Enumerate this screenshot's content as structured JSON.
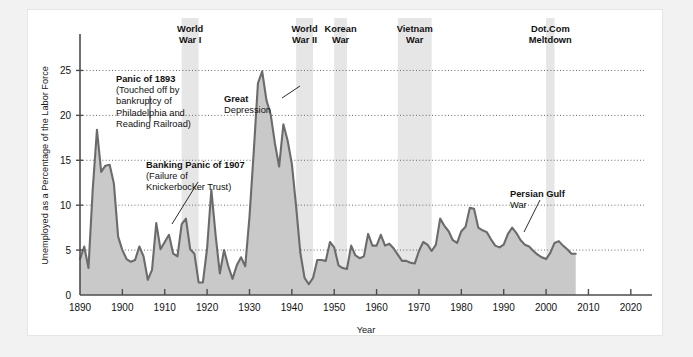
{
  "chart_data": {
    "type": "area",
    "title": "",
    "xlabel": "Year",
    "ylabel": "Unemployed as a Percentage of the Labor Force",
    "xlim": [
      1890,
      2025
    ],
    "ylim": [
      0,
      27.5
    ],
    "xticks": [
      1890,
      1900,
      1910,
      1920,
      1930,
      1940,
      1950,
      1960,
      1970,
      1980,
      1990,
      2000,
      2010,
      2020
    ],
    "yticks": [
      0,
      5,
      10,
      15,
      20,
      25
    ],
    "grid": "horizontal-dotted",
    "legend": "none",
    "series_name": "Unemployment rate",
    "x": [
      1890,
      1891,
      1892,
      1893,
      1894,
      1895,
      1896,
      1897,
      1898,
      1899,
      1900,
      1901,
      1902,
      1903,
      1904,
      1905,
      1906,
      1907,
      1908,
      1909,
      1910,
      1911,
      1912,
      1913,
      1914,
      1915,
      1916,
      1917,
      1918,
      1919,
      1920,
      1921,
      1922,
      1923,
      1924,
      1925,
      1926,
      1927,
      1928,
      1929,
      1930,
      1931,
      1932,
      1933,
      1934,
      1935,
      1936,
      1937,
      1938,
      1939,
      1940,
      1941,
      1942,
      1943,
      1944,
      1945,
      1946,
      1947,
      1948,
      1949,
      1950,
      1951,
      1952,
      1953,
      1954,
      1955,
      1956,
      1957,
      1958,
      1959,
      1960,
      1961,
      1962,
      1963,
      1964,
      1965,
      1966,
      1967,
      1968,
      1969,
      1970,
      1971,
      1972,
      1973,
      1974,
      1975,
      1976,
      1977,
      1978,
      1979,
      1980,
      1981,
      1982,
      1983,
      1984,
      1985,
      1986,
      1987,
      1988,
      1989,
      1990,
      1991,
      1992,
      1993,
      1994,
      1995,
      1996,
      1997,
      1998,
      1999,
      2000,
      2001,
      2002,
      2003,
      2004,
      2005,
      2006,
      2007
    ],
    "values": [
      4.0,
      5.4,
      3.0,
      11.7,
      18.4,
      13.7,
      14.4,
      14.5,
      12.4,
      6.5,
      5.0,
      4.0,
      3.7,
      3.9,
      5.4,
      4.3,
      1.7,
      2.8,
      8.0,
      5.1,
      5.9,
      6.7,
      4.6,
      4.3,
      7.9,
      8.5,
      5.1,
      4.6,
      1.4,
      1.4,
      5.2,
      11.7,
      6.7,
      2.4,
      5.0,
      3.2,
      1.8,
      3.3,
      4.2,
      3.2,
      8.7,
      15.9,
      23.6,
      24.9,
      21.7,
      20.1,
      16.9,
      14.3,
      19.0,
      17.2,
      14.6,
      9.9,
      4.7,
      1.9,
      1.2,
      1.9,
      3.9,
      3.9,
      3.8,
      5.9,
      5.3,
      3.3,
      3.0,
      2.9,
      5.5,
      4.4,
      4.1,
      4.3,
      6.8,
      5.5,
      5.5,
      6.7,
      5.5,
      5.7,
      5.2,
      4.5,
      3.8,
      3.8,
      3.6,
      3.5,
      4.9,
      5.9,
      5.6,
      4.9,
      5.6,
      8.5,
      7.7,
      7.1,
      6.1,
      5.8,
      7.1,
      7.6,
      9.7,
      9.6,
      7.5,
      7.2,
      7.0,
      6.2,
      5.5,
      5.3,
      5.6,
      6.8,
      7.5,
      6.9,
      6.1,
      5.6,
      5.4,
      4.9,
      4.5,
      4.2,
      4.0,
      4.7,
      5.8,
      6.0,
      5.5,
      5.1,
      4.6,
      4.6
    ],
    "annotations": [
      {
        "name": "panic-1893",
        "lines": [
          "Panic of 1893",
          "(Touched off by",
          "bankruptcy of",
          "Philadelphia and",
          "Reading Railroad)"
        ],
        "bold_first_line": true
      },
      {
        "name": "banking-panic-1907",
        "lines": [
          "Banking Panic of 1907",
          "(Failure of",
          "Knickerbocker Trust)"
        ],
        "bold_first_line": true
      },
      {
        "name": "great-depression",
        "lines": [
          "Great",
          "Depression"
        ],
        "bold_first_line": true
      },
      {
        "name": "persian-gulf-war",
        "lines": [
          "Persian Gulf",
          "War"
        ],
        "bold_first_line": true
      }
    ],
    "shaded_bands": [
      {
        "label_lines": [
          "World",
          "War I"
        ],
        "start": 1914,
        "end": 1918
      },
      {
        "label_lines": [
          "World",
          "War II"
        ],
        "start": 1941,
        "end": 1945
      },
      {
        "label_lines": [
          "Korean",
          "War"
        ],
        "start": 1950,
        "end": 1953
      },
      {
        "label_lines": [
          "Vietnam",
          "War"
        ],
        "start": 1965,
        "end": 1973
      },
      {
        "label_lines": [
          "Dot.Com",
          "Meltdown"
        ],
        "start": 2000,
        "end": 2002
      }
    ],
    "colors": {
      "area_fill": "#c9c9c9",
      "line": "#6b6b6b",
      "band_fill": "#e6e6e6",
      "axis": "#4d4d4d",
      "grid": "#5a5a5a",
      "page_background": "#f2f2f2",
      "card_background": "#ffffff"
    }
  }
}
